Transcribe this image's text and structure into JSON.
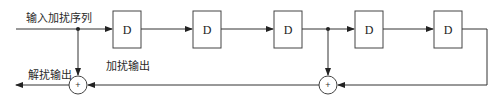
{
  "diagram": {
    "type": "scrambler-descrambler block diagram",
    "labels": {
      "input": "输入加扰序列",
      "scrambled_output": "加扰输出",
      "descrambled_output": "解扰输出"
    },
    "delay_blocks": [
      {
        "id": "d1",
        "label": "D"
      },
      {
        "id": "d2",
        "label": "D"
      },
      {
        "id": "d3",
        "label": "D"
      },
      {
        "id": "d4",
        "label": "D"
      },
      {
        "id": "d5",
        "label": "D"
      }
    ],
    "adders": [
      {
        "id": "adder1",
        "symbol": "+"
      },
      {
        "id": "adder2",
        "symbol": "+"
      }
    ],
    "colors": {
      "line": "#333333",
      "box_border": "#444444",
      "background": "#ffffff"
    }
  }
}
